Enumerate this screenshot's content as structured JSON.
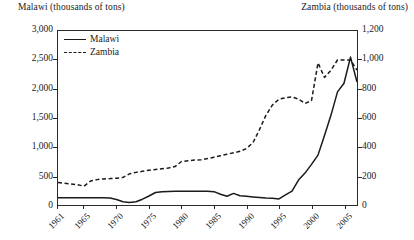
{
  "chart_data": {
    "type": "line",
    "title": "",
    "left_axis": {
      "label": "Malawi (thousands of tons)",
      "ticks": [
        "0",
        "500",
        "1,000",
        "1,500",
        "2,000",
        "2,500",
        "3,000"
      ],
      "min": 0,
      "max": 3000
    },
    "right_axis": {
      "label": "Zambia (thousands of tons)",
      "ticks": [
        "0",
        "200",
        "400",
        "600",
        "800",
        "1,000",
        "1,200"
      ],
      "min": 0,
      "max": 1200
    },
    "xlabel": "",
    "xlim": [
      1961,
      2007
    ],
    "xticks": [
      "1961",
      "1965",
      "1970",
      "1975",
      "1980",
      "1985",
      "1990",
      "1995",
      "2000",
      "2005"
    ],
    "xtick_years": [
      1961,
      1965,
      1970,
      1975,
      1980,
      1985,
      1990,
      1995,
      2000,
      2005
    ],
    "grid": false,
    "legend_position": "top-left",
    "legend": [
      "Malawi",
      "Zambia"
    ],
    "series": [
      {
        "name": "Malawi",
        "axis": "left",
        "style": "solid",
        "color": "#1a1a1a",
        "x": [
          1961,
          1962,
          1963,
          1964,
          1965,
          1966,
          1967,
          1968,
          1969,
          1970,
          1971,
          1972,
          1973,
          1974,
          1975,
          1976,
          1977,
          1978,
          1979,
          1980,
          1981,
          1982,
          1983,
          1984,
          1985,
          1986,
          1987,
          1988,
          1989,
          1990,
          1991,
          1992,
          1993,
          1994,
          1995,
          1996,
          1997,
          1998,
          1999,
          2000,
          2001,
          2002,
          2003,
          2004,
          2005,
          2006,
          2007
        ],
        "y": [
          125,
          125,
          125,
          125,
          125,
          125,
          125,
          125,
          120,
          95,
          55,
          45,
          55,
          100,
          155,
          215,
          230,
          232,
          235,
          235,
          235,
          235,
          235,
          235,
          230,
          185,
          150,
          200,
          160,
          150,
          140,
          130,
          120,
          115,
          105,
          175,
          240,
          430,
          550,
          700,
          860,
          1200,
          1550,
          1950,
          2100,
          2550,
          2120
        ]
      },
      {
        "name": "Zambia",
        "axis": "right",
        "style": "dashed",
        "color": "#1a1a1a",
        "x": [
          1961,
          1962,
          1963,
          1964,
          1965,
          1966,
          1967,
          1968,
          1969,
          1970,
          1971,
          1972,
          1973,
          1974,
          1975,
          1976,
          1977,
          1978,
          1979,
          1980,
          1981,
          1982,
          1983,
          1984,
          1985,
          1986,
          1987,
          1988,
          1989,
          1990,
          1991,
          1992,
          1993,
          1994,
          1995,
          1996,
          1997,
          1998,
          1999,
          2000,
          2001,
          2002,
          2003,
          2004,
          2005,
          2006,
          2007
        ],
        "y": [
          155,
          150,
          145,
          140,
          130,
          165,
          175,
          180,
          182,
          185,
          190,
          215,
          225,
          232,
          240,
          245,
          250,
          255,
          265,
          300,
          305,
          310,
          312,
          320,
          330,
          340,
          350,
          360,
          370,
          390,
          430,
          520,
          620,
          690,
          730,
          740,
          745,
          730,
          700,
          720,
          980,
          880,
          930,
          1000,
          1000,
          1000,
          930
        ]
      }
    ]
  }
}
